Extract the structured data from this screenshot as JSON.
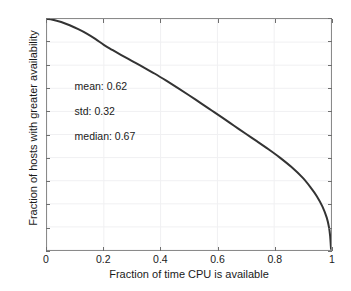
{
  "chart_data": {
    "type": "line",
    "title": "",
    "xlabel": "Fraction of time CPU is available",
    "ylabel": "Fraction of hosts with greater availability",
    "xlim": [
      0,
      1
    ],
    "ylim": [
      0,
      1
    ],
    "grid": true,
    "legend": null,
    "xticks": [
      "0",
      "0.2",
      "0.4",
      "0.6",
      "0.8",
      "1"
    ],
    "xtick_values": [
      0,
      0.2,
      0.4,
      0.6,
      0.8,
      1
    ],
    "yticks": [
      "0",
      "0.1",
      "0.2",
      "0.3",
      "0.4",
      "0.5",
      "0.6",
      "0.7",
      "0.8",
      "0.9",
      "1"
    ],
    "ytick_values": [
      0,
      0.1,
      0.2,
      0.3,
      0.4,
      0.5,
      0.6,
      0.7,
      0.8,
      0.9,
      1
    ],
    "series": [
      {
        "name": "CCDF of host CPU availability",
        "color": "#333333",
        "x": [
          0.0,
          0.02,
          0.05,
          0.08,
          0.11,
          0.14,
          0.17,
          0.2,
          0.23,
          0.26,
          0.3,
          0.34,
          0.38,
          0.42,
          0.46,
          0.5,
          0.54,
          0.58,
          0.62,
          0.66,
          0.7,
          0.74,
          0.78,
          0.82,
          0.86,
          0.9,
          0.93,
          0.95,
          0.97,
          0.985,
          0.993,
          0.997,
          1.0
        ],
        "y": [
          1.0,
          0.997,
          0.987,
          0.973,
          0.956,
          0.937,
          0.914,
          0.888,
          0.866,
          0.845,
          0.818,
          0.791,
          0.763,
          0.733,
          0.702,
          0.67,
          0.637,
          0.604,
          0.571,
          0.537,
          0.503,
          0.47,
          0.436,
          0.4,
          0.36,
          0.313,
          0.268,
          0.233,
          0.188,
          0.14,
          0.098,
          0.06,
          0.005
        ]
      }
    ],
    "annotations": [
      {
        "text": "mean: 0.62",
        "x": 0.1,
        "y": 0.705
      },
      {
        "text": "std: 0.32",
        "x": 0.1,
        "y": 0.598
      },
      {
        "text": "median: 0.67",
        "x": 0.1,
        "y": 0.492
      }
    ],
    "stats": {
      "mean": 0.62,
      "std": 0.32,
      "median": 0.67
    }
  }
}
